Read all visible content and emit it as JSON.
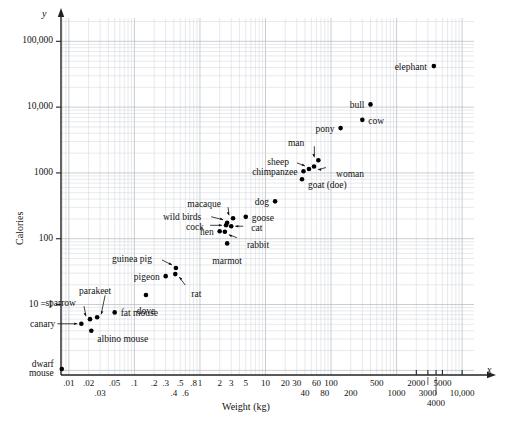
{
  "chart_data": {
    "type": "scatter",
    "title": "",
    "xlabel": "Weight (kg)",
    "ylabel": "Calories",
    "x_axis_var": "x",
    "y_axis_var": "y",
    "xscale": "log",
    "yscale": "log",
    "grid": true,
    "xlim": [
      0.007,
      14000
    ],
    "ylim": [
      0.8,
      200000
    ],
    "y_special_tick_note": "10 = 1",
    "xticks_row1": [
      "0.01",
      "0.02",
      "0.05",
      "0.1",
      "0.2",
      "0.3",
      "0.5",
      "0.8",
      "1",
      "2",
      "3",
      "5",
      "10",
      "20",
      "30",
      "60",
      "100",
      "500",
      "2000",
      "5000"
    ],
    "xticks_row2": [
      "0.03",
      "0.4",
      "0.6",
      "40",
      "80",
      "200",
      "1000",
      "3000",
      "4000",
      "10,000"
    ],
    "xticks": [
      {
        "label": ".01",
        "value": 0.01,
        "row": 1
      },
      {
        "label": ".02",
        "value": 0.02,
        "row": 1
      },
      {
        "label": ".03",
        "value": 0.03,
        "row": 2
      },
      {
        "label": ".05",
        "value": 0.05,
        "row": 1
      },
      {
        "label": ".1",
        "value": 0.1,
        "row": 1
      },
      {
        "label": ".2",
        "value": 0.2,
        "row": 1
      },
      {
        "label": ".3",
        "value": 0.3,
        "row": 1
      },
      {
        "label": ".4",
        "value": 0.4,
        "row": 2
      },
      {
        "label": ".5",
        "value": 0.5,
        "row": 1
      },
      {
        "label": ".6",
        "value": 0.6,
        "row": 2
      },
      {
        "label": ".8",
        "value": 0.8,
        "row": 1
      },
      {
        "label": "1",
        "value": 1,
        "row": 1
      },
      {
        "label": "2",
        "value": 2,
        "row": 1
      },
      {
        "label": "3",
        "value": 3,
        "row": 1
      },
      {
        "label": "5",
        "value": 5,
        "row": 1
      },
      {
        "label": "10",
        "value": 10,
        "row": 1
      },
      {
        "label": "20",
        "value": 20,
        "row": 1
      },
      {
        "label": "30",
        "value": 30,
        "row": 1
      },
      {
        "label": "40",
        "value": 40,
        "row": 2
      },
      {
        "label": "60",
        "value": 60,
        "row": 1
      },
      {
        "label": "80",
        "value": 80,
        "row": 2
      },
      {
        "label": "100",
        "value": 100,
        "row": 1
      },
      {
        "label": "200",
        "value": 200,
        "row": 2
      },
      {
        "label": "500",
        "value": 500,
        "row": 1
      },
      {
        "label": "1000",
        "value": 1000,
        "row": 2
      },
      {
        "label": "2000",
        "value": 2000,
        "row": 1
      },
      {
        "label": "3000",
        "value": 3000,
        "row": 2
      },
      {
        "label": "4000",
        "value": 4000,
        "row": 3
      },
      {
        "label": "5000",
        "value": 5000,
        "row": 1
      },
      {
        "label": "10,000",
        "value": 10000,
        "row": 2
      }
    ],
    "yticks": [
      {
        "label": "100,000",
        "value": 100000
      },
      {
        "label": "10,000",
        "value": 10000
      },
      {
        "label": "1000",
        "value": 1000
      },
      {
        "label": "100",
        "value": 100
      },
      {
        "label": "10 = 1",
        "value": 10
      }
    ],
    "points": [
      {
        "name": "dwarf mouse",
        "weight": 0.0078,
        "calories": 1.05,
        "label": "dwarf\nmouse",
        "label_pos": "left"
      },
      {
        "name": "canary",
        "weight": 0.0155,
        "calories": 5.1,
        "label": "canary",
        "label_pos": "left-arrow"
      },
      {
        "name": "sparrow",
        "weight": 0.021,
        "calories": 6.0,
        "label": "sparrow",
        "label_pos": "up-arrow"
      },
      {
        "name": "albino mouse",
        "weight": 0.022,
        "calories": 4.0,
        "label": "albino mouse",
        "label_pos": "right"
      },
      {
        "name": "parakeet",
        "weight": 0.027,
        "calories": 6.4,
        "label": "parakeet",
        "label_pos": "up-arrow"
      },
      {
        "name": "fat mouse",
        "weight": 0.05,
        "calories": 7.6,
        "label": "fat mouse",
        "label_pos": "right"
      },
      {
        "name": "dove",
        "weight": 0.15,
        "calories": 14.0,
        "label": "dove",
        "label_pos": "below"
      },
      {
        "name": "pigeon",
        "weight": 0.3,
        "calories": 27.0,
        "label": "pigeon",
        "label_pos": "left"
      },
      {
        "name": "guinea pig",
        "weight": 0.43,
        "calories": 36.0,
        "label": "guinea pig",
        "label_pos": "left-arrow"
      },
      {
        "name": "rat",
        "weight": 0.42,
        "calories": 29.0,
        "label": "rat",
        "label_pos": "below-arrow"
      },
      {
        "name": "marmot",
        "weight": 2.6,
        "calories": 85.0,
        "label": "marmot",
        "label_pos": "below"
      },
      {
        "name": "hen",
        "weight": 2.0,
        "calories": 130.0,
        "label": "hen",
        "label_pos": "left"
      },
      {
        "name": "rabbit",
        "weight": 2.4,
        "calories": 128.0,
        "label": "rabbit",
        "label_pos": "right-arrow"
      },
      {
        "name": "cock",
        "weight": 2.5,
        "calories": 160.0,
        "label": "cock",
        "label_pos": "left-arrow"
      },
      {
        "name": "wild birds",
        "weight": 2.6,
        "calories": 175.0,
        "label": "wild birds",
        "label_pos": "left-arrow"
      },
      {
        "name": "cat",
        "weight": 3.0,
        "calories": 155.0,
        "label": "cat",
        "label_pos": "right-arrow"
      },
      {
        "name": "macaque",
        "weight": 3.2,
        "calories": 205.0,
        "label": "macaque",
        "label_pos": "up-arrow"
      },
      {
        "name": "goose",
        "weight": 5.0,
        "calories": 215.0,
        "label": "goose",
        "label_pos": "right"
      },
      {
        "name": "dog",
        "weight": 14.0,
        "calories": 370.0,
        "label": "dog",
        "label_pos": "left"
      },
      {
        "name": "chimpanzee",
        "weight": 38.0,
        "calories": 1060.0,
        "label": "chimpanzee",
        "label_pos": "left"
      },
      {
        "name": "goat (doe)",
        "weight": 36.0,
        "calories": 800.0,
        "label": "goat (doe)",
        "label_pos": "right"
      },
      {
        "name": "sheep",
        "weight": 46.0,
        "calories": 1150.0,
        "label": "sheep",
        "label_pos": "left-arrow"
      },
      {
        "name": "man",
        "weight": 64.0,
        "calories": 1560.0,
        "label": "man",
        "label_pos": "up-arrow"
      },
      {
        "name": "woman",
        "weight": 55.0,
        "calories": 1250.0,
        "label": "woman",
        "label_pos": "right-arrow"
      },
      {
        "name": "pony",
        "weight": 140.0,
        "calories": 4800.0,
        "label": "pony",
        "label_pos": "left"
      },
      {
        "name": "cow",
        "weight": 300.0,
        "calories": 6400.0,
        "label": "cow",
        "label_pos": "right"
      },
      {
        "name": "bull",
        "weight": 400.0,
        "calories": 11000.0,
        "label": "bull",
        "label_pos": "left"
      },
      {
        "name": "elephant",
        "weight": 3700.0,
        "calories": 42000.0,
        "label": "elephant",
        "label_pos": "left"
      }
    ]
  }
}
